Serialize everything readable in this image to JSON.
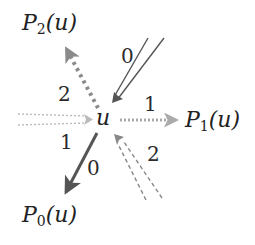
{
  "diagram": {
    "center_node": "u",
    "nodes": [
      {
        "id": "p2",
        "prefix": "P",
        "sub": "2",
        "suffix": "(u)"
      },
      {
        "id": "p1",
        "prefix": "P",
        "sub": "1",
        "suffix": "(u)"
      },
      {
        "id": "p0",
        "prefix": "P",
        "sub": "0",
        "suffix": "(u)"
      }
    ],
    "edges": [
      {
        "from": "u",
        "to": "P2(u)",
        "label": "2",
        "style": "dotted-thick",
        "color": "#8a8a8a"
      },
      {
        "from": "u",
        "to": "P1(u)",
        "label": "1",
        "style": "dotted",
        "color": "#aaaaaa"
      },
      {
        "from": "u",
        "to": "P0(u)",
        "label": "0",
        "style": "solid-thick",
        "color": "#555555"
      },
      {
        "from": "upper-right",
        "to": "u",
        "label": "0",
        "style": "double-solid",
        "color": "#555555"
      },
      {
        "from": "left",
        "to": "u",
        "label": "1",
        "style": "double-dotted",
        "color": "#bbbbbb"
      },
      {
        "from": "lower-right",
        "to": "u",
        "label": "2",
        "style": "double-dashed",
        "color": "#888888"
      }
    ],
    "edge_labels": {
      "out_p2": "2",
      "out_p1": "1",
      "out_p0": "0",
      "in_top": "0",
      "in_left": "1",
      "in_bottom": "2"
    }
  }
}
